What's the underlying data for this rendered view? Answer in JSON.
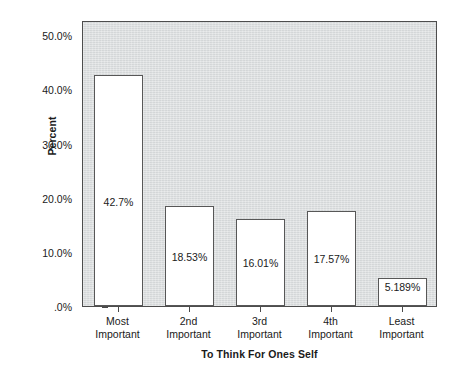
{
  "chart_data": {
    "type": "bar",
    "title": "",
    "xlabel": "To Think For Ones Self",
    "ylabel": "Percent",
    "categories": [
      "Most Important",
      "2nd Important",
      "3rd Important",
      "4th Important",
      "Least Important"
    ],
    "category_lines": [
      [
        "Most",
        "Important"
      ],
      [
        "2nd",
        "Important"
      ],
      [
        "3rd",
        "Important"
      ],
      [
        "4th",
        "Important"
      ],
      [
        "Least",
        "Important"
      ]
    ],
    "values": [
      42.7,
      18.53,
      16.01,
      17.57,
      5.189
    ],
    "value_labels": [
      "42.7%",
      "18.53%",
      "16.01%",
      "17.57%",
      "5.189%"
    ],
    "ylim": [
      0,
      52.8
    ],
    "ytick_values": [
      50.0,
      40.0,
      30.0,
      20.0,
      10.0,
      0.0
    ],
    "ytick_labels": [
      "50.0%",
      "40.0%",
      "30.0%",
      "20.0%",
      "10.0%",
      ".0%"
    ],
    "grid": false,
    "legend": false,
    "legend_position": "none",
    "colors": {
      "plot_background": "#d9dcdd",
      "bar_fill": "#ffffff",
      "bar_border": "#575757",
      "axis": "#4d4d4d",
      "text": "#1a1a1a",
      "page_background": "#ffffff"
    }
  }
}
